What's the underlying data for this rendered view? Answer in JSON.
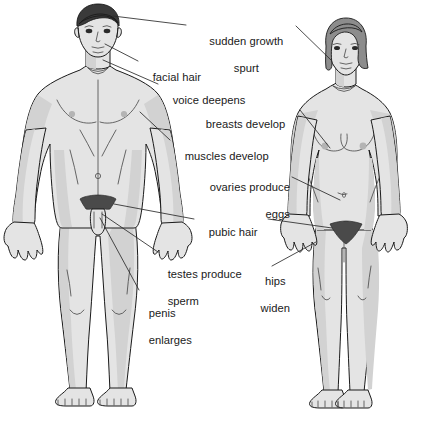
{
  "diagram": {
    "background_color": "#ffffff",
    "line_color": "#1a1a1a",
    "skin_color": "#e4e4e4",
    "skin_shade_color": "#d0d0d0",
    "male_hair_color": "#3a3a3a",
    "female_hair_color": "#8c8c8c",
    "pubic_hair_color": "#4a4a4a",
    "leader_line_color": "#2b2b2b",
    "text_color": "#1a1a1a"
  },
  "figures": [
    {
      "id": "male-figure",
      "name": "male figure",
      "hair_color": "#3a3a3a",
      "skin_color": "#e4e4e4"
    },
    {
      "id": "female-figure",
      "name": "female figure",
      "hair_color": "#8c8c8c",
      "skin_color": "#e4e4e4"
    }
  ],
  "labels": [
    {
      "id": "sudden-growth-spurt",
      "line1": "sudden growth",
      "line2": "spurt",
      "align": "center",
      "x": 188,
      "y": 22,
      "width": 104
    },
    {
      "id": "facial-hair",
      "line1": "facial hair",
      "line2": "",
      "align": "left",
      "x": 140,
      "y": 58,
      "width": 90
    },
    {
      "id": "voice-deepens",
      "line1": "voice deepens",
      "line2": "",
      "align": "left",
      "x": 160,
      "y": 81,
      "width": 100
    },
    {
      "id": "breasts-develop",
      "line1": "breasts develop",
      "line2": "",
      "align": "left",
      "x": 193,
      "y": 105,
      "width": 104
    },
    {
      "id": "muscles-develop",
      "line1": "muscles develop",
      "line2": "",
      "align": "left",
      "x": 172,
      "y": 137,
      "width": 106
    },
    {
      "id": "ovaries-produce-eggs",
      "line1": "ovaries produce",
      "line2": "eggs",
      "align": "right",
      "x": 186,
      "y": 168,
      "width": 104
    },
    {
      "id": "pubic-hair",
      "line1": "pubic hair",
      "line2": "",
      "align": "left",
      "x": 196,
      "y": 215,
      "width": 70
    },
    {
      "id": "testes-produce-sperm",
      "line1": "testes produce",
      "line2": "sperm",
      "align": "left",
      "x": 155,
      "y": 255,
      "width": 96
    },
    {
      "id": "hips-widen",
      "line1": "hips",
      "line2": "widen",
      "align": "center",
      "x": 249,
      "y": 262,
      "width": 44
    },
    {
      "id": "penis-enlarges",
      "line1": "penis",
      "line2": "enlarges",
      "align": "left",
      "x": 136,
      "y": 294,
      "width": 66
    }
  ]
}
